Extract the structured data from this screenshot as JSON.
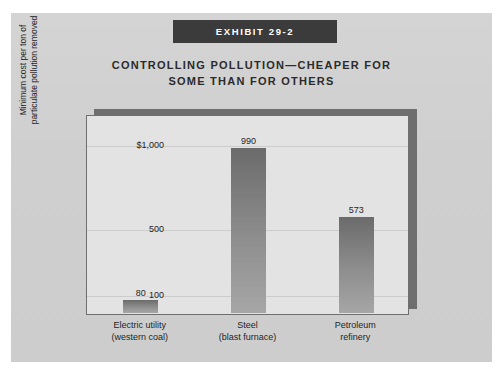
{
  "exhibit": {
    "banner_label": "EXHIBIT 29-2"
  },
  "chart_data": {
    "type": "bar",
    "title": "CONTROLLING POLLUTION—CHEAPER FOR SOME THAN FOR OTHERS",
    "title_lines": [
      "CONTROLLING POLLUTION—CHEAPER FOR",
      "SOME THAN FOR OTHERS"
    ],
    "categories": [
      "Electric utility (western coal)",
      "Steel (blast furnace)",
      "Petroleum refinery"
    ],
    "category_lines": [
      [
        "Electric utility",
        "(western coal)"
      ],
      [
        "Steel",
        "(blast furnace)"
      ],
      [
        "Petroleum",
        "refinery"
      ]
    ],
    "values": [
      80,
      990,
      573
    ],
    "value_labels": [
      "80",
      "990",
      "573"
    ],
    "xlabel": "",
    "ylabel": "Minimum cost per ton of particulate pollution removed",
    "ylabel_lines": [
      "Minimum cost per ton of",
      "particulate pollution removed"
    ],
    "ylim": [
      0,
      1180
    ],
    "yticks": [
      100,
      500,
      1000
    ],
    "ytick_labels": [
      "100",
      "500",
      "$1,000"
    ],
    "grid": true,
    "legend": null,
    "bar_color": "#8e8e8e",
    "plot_background": "#e3e3e3",
    "figure_background": "#d2d2d2",
    "banner_color": "#3b3b3b"
  }
}
